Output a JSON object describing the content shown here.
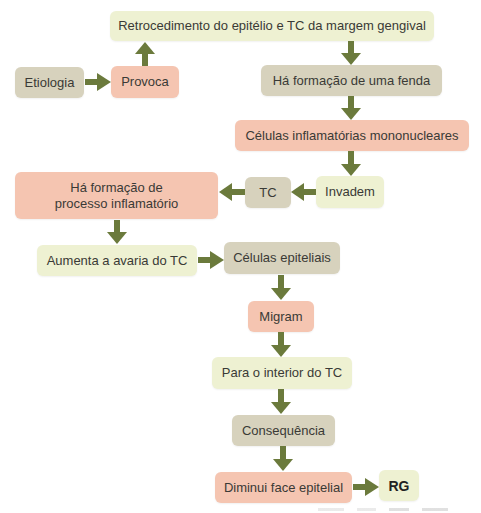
{
  "diagram": {
    "type": "flowchart",
    "colors": {
      "green": "#eef1d2",
      "tan": "#d7d2bd",
      "pink": "#f5c5b1",
      "arrow": "#6b7a3c",
      "text": "#3a3a36"
    },
    "nodes": {
      "retrocedimento": "Retrocedimento do epitélio e TC da margem gengival",
      "etiologia": "Etiologia",
      "provoca": "Provoca",
      "fenda": "Há formação de uma fenda",
      "celulas_inflamatorias": "Células inflamatórias mononucleares",
      "invadem": "Invadem",
      "tc": "TC",
      "processo_inflamatorio": "Há formação de processo inflamatório",
      "aumenta_avaria": "Aumenta a avaria do TC",
      "celulas_epiteliais": "Células epiteliais",
      "migram": "Migram",
      "interior_tc": "Para o interior do TC",
      "consequencia": "Consequência",
      "diminui_face": "Diminui face epitelial",
      "rg": "RG"
    },
    "edges": [
      [
        "Etiologia",
        "Provoca"
      ],
      [
        "Provoca",
        "Retrocedimento do epitélio e TC da margem gengival"
      ],
      [
        "Retrocedimento do epitélio e TC da margem gengival",
        "Há formação de uma fenda"
      ],
      [
        "Há formação de uma fenda",
        "Células inflamatórias mononucleares"
      ],
      [
        "Células inflamatórias mononucleares",
        "Invadem"
      ],
      [
        "Invadem",
        "TC"
      ],
      [
        "TC",
        "Há formação de processo inflamatório"
      ],
      [
        "Há formação de processo inflamatório",
        "Aumenta a avaria do TC"
      ],
      [
        "Aumenta a avaria do TC",
        "Células epiteliais"
      ],
      [
        "Células epiteliais",
        "Migram"
      ],
      [
        "Migram",
        "Para o interior do TC"
      ],
      [
        "Para o interior do TC",
        "Consequência"
      ],
      [
        "Consequência",
        "Diminui face epitelial"
      ],
      [
        "Diminui face epitelial",
        "RG"
      ]
    ]
  }
}
